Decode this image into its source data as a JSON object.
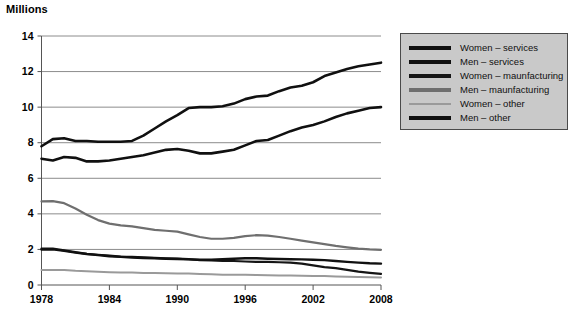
{
  "chart_data": {
    "type": "line",
    "title": "Millions",
    "ylabel": "Millions",
    "xlabel": "",
    "xlim": [
      1978,
      2008
    ],
    "ylim": [
      0,
      14
    ],
    "grid": true,
    "legend_position": "right",
    "x": [
      1978,
      1979,
      1980,
      1981,
      1982,
      1983,
      1984,
      1985,
      1986,
      1987,
      1988,
      1989,
      1990,
      1991,
      1992,
      1993,
      1994,
      1995,
      1996,
      1997,
      1998,
      1999,
      2000,
      2001,
      2002,
      2003,
      2004,
      2005,
      2006,
      2007,
      2008
    ],
    "x_ticks": [
      "1978",
      "1984",
      "1990",
      "1996",
      "2002",
      "2008"
    ],
    "y_ticks": [
      "0",
      "2",
      "4",
      "6",
      "8",
      "10",
      "12",
      "14"
    ],
    "series": [
      {
        "name": "Women – services",
        "color": "#101010",
        "width": 2.6,
        "values": [
          7.8,
          8.2,
          8.25,
          8.1,
          8.1,
          8.05,
          8.05,
          8.05,
          8.1,
          8.4,
          8.8,
          9.2,
          9.55,
          9.95,
          10.0,
          10.0,
          10.05,
          10.2,
          10.45,
          10.6,
          10.65,
          10.9,
          11.1,
          11.2,
          11.4,
          11.75,
          11.95,
          12.15,
          12.3,
          12.4,
          12.5
        ]
      },
      {
        "name": "Men – services",
        "color": "#101010",
        "width": 2.6,
        "values": [
          7.1,
          7.0,
          7.2,
          7.15,
          6.95,
          6.95,
          7.0,
          7.1,
          7.2,
          7.3,
          7.45,
          7.6,
          7.65,
          7.55,
          7.4,
          7.4,
          7.5,
          7.6,
          7.85,
          8.1,
          8.15,
          8.4,
          8.65,
          8.85,
          9.0,
          9.2,
          9.45,
          9.65,
          9.8,
          9.95,
          10.0
        ]
      },
      {
        "name": "Women – maunfacturing",
        "color": "#151515",
        "width": 2.2,
        "values": [
          2.05,
          2.05,
          1.95,
          1.85,
          1.75,
          1.7,
          1.65,
          1.6,
          1.58,
          1.55,
          1.52,
          1.5,
          1.48,
          1.45,
          1.4,
          1.38,
          1.36,
          1.35,
          1.32,
          1.3,
          1.3,
          1.28,
          1.26,
          1.2,
          1.1,
          1.0,
          0.95,
          0.85,
          0.75,
          0.68,
          0.62
        ]
      },
      {
        "name": "Men – maunfacturing",
        "color": "#6f6f6f",
        "width": 2.2,
        "values": [
          4.7,
          4.72,
          4.6,
          4.3,
          3.95,
          3.65,
          3.45,
          3.35,
          3.3,
          3.2,
          3.1,
          3.05,
          3.0,
          2.85,
          2.7,
          2.6,
          2.6,
          2.65,
          2.75,
          2.8,
          2.78,
          2.7,
          2.6,
          2.5,
          2.4,
          2.3,
          2.2,
          2.12,
          2.05,
          2.0,
          1.98
        ]
      },
      {
        "name": "Women – other",
        "color": "#9a9a9a",
        "width": 2.0,
        "values": [
          0.85,
          0.85,
          0.85,
          0.8,
          0.78,
          0.75,
          0.72,
          0.7,
          0.7,
          0.68,
          0.67,
          0.66,
          0.65,
          0.64,
          0.62,
          0.6,
          0.58,
          0.58,
          0.57,
          0.56,
          0.55,
          0.54,
          0.53,
          0.52,
          0.5,
          0.5,
          0.48,
          0.46,
          0.45,
          0.44,
          0.42
        ]
      },
      {
        "name": "Men – other",
        "color": "#101010",
        "width": 2.4,
        "values": [
          2.0,
          2.0,
          1.92,
          1.82,
          1.74,
          1.68,
          1.62,
          1.58,
          1.55,
          1.52,
          1.5,
          1.48,
          1.46,
          1.44,
          1.42,
          1.42,
          1.45,
          1.48,
          1.5,
          1.5,
          1.48,
          1.46,
          1.45,
          1.44,
          1.42,
          1.4,
          1.35,
          1.3,
          1.26,
          1.22,
          1.2
        ]
      }
    ]
  },
  "legend": {
    "items": [
      {
        "label": "Women – services",
        "color": "#101010"
      },
      {
        "label": "Men – services",
        "color": "#101010"
      },
      {
        "label": "Women – maunfacturing",
        "color": "#151515"
      },
      {
        "label": "Men – maunfacturing",
        "color": "#6f6f6f"
      },
      {
        "label": "Women – other",
        "color": "#9a9a9a"
      },
      {
        "label": "Men – other",
        "color": "#101010"
      }
    ]
  }
}
